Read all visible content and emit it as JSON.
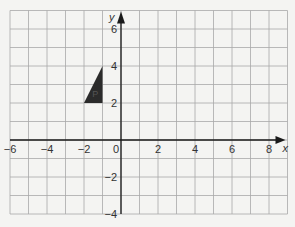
{
  "diagram": {
    "type": "coordinate-grid",
    "x_axis": {
      "label": "x",
      "range": [
        -6,
        9
      ],
      "tick_labels": [
        {
          "value": -6,
          "text": "−6"
        },
        {
          "value": -4,
          "text": "−4"
        },
        {
          "value": -2,
          "text": "−2"
        },
        {
          "value": 0,
          "text": "0"
        },
        {
          "value": 2,
          "text": "2"
        },
        {
          "value": 4,
          "text": "4"
        },
        {
          "value": 6,
          "text": "6"
        },
        {
          "value": 8,
          "text": "8"
        }
      ]
    },
    "y_axis": {
      "label": "y",
      "range": [
        -4,
        7
      ],
      "tick_labels": [
        {
          "value": 6,
          "text": "6"
        },
        {
          "value": 4,
          "text": "4"
        },
        {
          "value": 2,
          "text": "2"
        },
        {
          "value": -2,
          "text": "−2"
        },
        {
          "value": -4,
          "text": "−4"
        }
      ]
    },
    "shapes": [
      {
        "name": "P",
        "label": "P",
        "type": "triangle",
        "vertices": [
          [
            -2,
            2
          ],
          [
            -1,
            2
          ],
          [
            -1,
            4
          ]
        ],
        "fill": "#2b2b2b"
      }
    ],
    "colors": {
      "grid": "#a8a8a8",
      "axis": "#1a1a1a",
      "background": "#f4f4f2"
    }
  }
}
